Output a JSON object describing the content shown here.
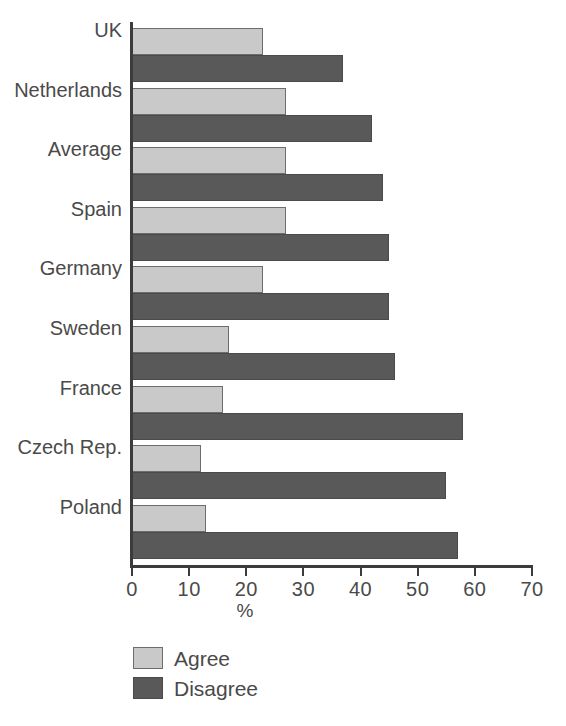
{
  "chart_data": {
    "type": "bar",
    "orientation": "horizontal",
    "title": "",
    "xlabel": "%",
    "ylabel": "",
    "xlim": [
      0,
      70
    ],
    "xticks": [
      0,
      10,
      20,
      30,
      40,
      50,
      60,
      70
    ],
    "grid": false,
    "legend_position": "bottom-left",
    "categories": [
      "UK",
      "Netherlands",
      "Average",
      "Spain",
      "Germany",
      "Sweden",
      "France",
      "Czech Rep.",
      "Poland"
    ],
    "series": [
      {
        "name": "Agree",
        "color": "#c9c9c9",
        "values": [
          23,
          27,
          27,
          27,
          23,
          17,
          16,
          12,
          13
        ]
      },
      {
        "name": "Disagree",
        "color": "#595959",
        "values": [
          37,
          42,
          44,
          45,
          45,
          46,
          58,
          55,
          57
        ]
      }
    ]
  },
  "legend": {
    "items": [
      {
        "label": "Agree",
        "swatch": "agree"
      },
      {
        "label": "Disagree",
        "swatch": "disagree"
      }
    ]
  }
}
